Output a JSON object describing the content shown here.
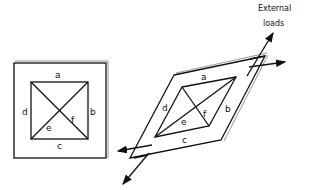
{
  "diagram": {
    "left_figure": {
      "description": "Square panel with inner square truss (unloaded)",
      "edge_labels": {
        "a": "a",
        "b": "b",
        "c": "c",
        "d": "d",
        "e": "e",
        "f": "f"
      }
    },
    "right_figure": {
      "description": "Panel sheared into rhombus under external loads",
      "edge_labels": {
        "a": "a",
        "b": "b",
        "c": "c",
        "d": "d",
        "e": "e",
        "f": "f"
      },
      "annotation_line1": "External",
      "annotation_line2": "loads"
    }
  }
}
